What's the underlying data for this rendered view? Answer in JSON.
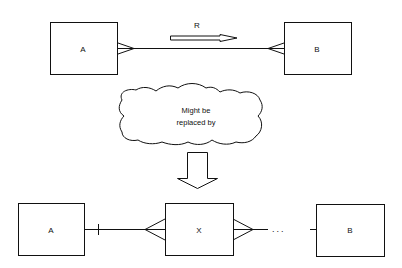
{
  "diagram": {
    "top": {
      "entity_a": {
        "label": "A"
      },
      "entity_b": {
        "label": "B"
      },
      "relationship": {
        "label": "R",
        "cardinality_a": "many",
        "cardinality_b": "many"
      }
    },
    "cloud": {
      "line1": "Might be",
      "line2": "replaced by"
    },
    "bottom": {
      "entity_a": {
        "label": "A"
      },
      "entity_x": {
        "label": "X"
      },
      "entity_b": {
        "label": "B"
      },
      "ellipsis": "..."
    }
  }
}
